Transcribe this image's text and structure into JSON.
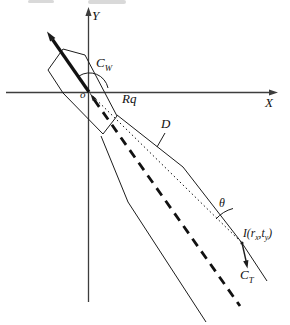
{
  "figure": {
    "background": "#ffffff",
    "ink": "#1c1c1c",
    "axis_color": "#3d3d3d",
    "axes": {
      "x": "X",
      "y": "Y",
      "origin": "o"
    },
    "ship": {
      "course_label": {
        "base": "C",
        "sub": "W"
      },
      "stern_label": "Rq"
    },
    "lines": {
      "distance_label": "D"
    },
    "target": {
      "angle_label": "θ",
      "point_label": {
        "p1": "I(r",
        "s1": "x",
        "p2": ",t",
        "s2": "y",
        "p3": ")"
      },
      "course_label": {
        "base": "C",
        "sub": "T"
      }
    }
  }
}
